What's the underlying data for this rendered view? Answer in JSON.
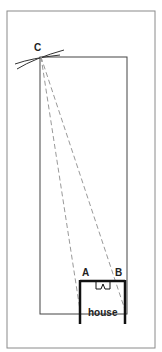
{
  "diagram": {
    "labels": {
      "point_c": "C",
      "point_a": "A",
      "point_b": "B",
      "house": "house"
    },
    "colors": {
      "frame": "#8a8a8a",
      "plot_outline": "#444444",
      "dashed_lines": "#999999",
      "house_walls": "#111111"
    }
  }
}
